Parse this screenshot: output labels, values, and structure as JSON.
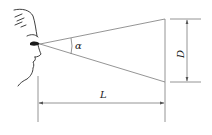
{
  "diagram": {
    "type": "viewing-angle-geometry",
    "labels": {
      "angle": "α",
      "height": "D",
      "distance": "L"
    },
    "colors": {
      "line": "#7a7a7a",
      "face": "#2a2a2a",
      "text": "#222222"
    }
  }
}
